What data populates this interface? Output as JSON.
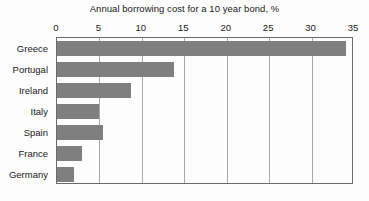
{
  "chart_data": {
    "type": "bar",
    "orientation": "horizontal",
    "title": "Annual borrowing cost for a 10 year bond, %",
    "xlabel": "",
    "ylabel": "",
    "xlim": [
      0,
      35
    ],
    "ylim": null,
    "grid": true,
    "legend": null,
    "axis_position": "top",
    "bar_color": "#7f7f7f",
    "categories": [
      "Greece",
      "Portugal",
      "Ireland",
      "Italy",
      "Spain",
      "France",
      "Germany"
    ],
    "values": [
      34.0,
      13.8,
      8.7,
      5.0,
      5.4,
      3.0,
      2.0
    ],
    "xticks": [
      0,
      5,
      10,
      15,
      20,
      25,
      30,
      35
    ],
    "xtick_labels": [
      "0",
      "5",
      "10",
      "15",
      "20",
      "25",
      "30",
      "35"
    ],
    "series": [
      {
        "name": "Annual borrowing cost",
        "values": [
          34.0,
          13.8,
          8.7,
          5.0,
          5.4,
          3.0,
          2.0
        ]
      }
    ]
  },
  "footer": {
    "source": ""
  },
  "colors": {
    "bar": "#7f7f7f",
    "grid": "#a9a9a9",
    "frame": "#6b6b6b",
    "text": "#1a1a1a",
    "background": "#fdfdfd"
  }
}
